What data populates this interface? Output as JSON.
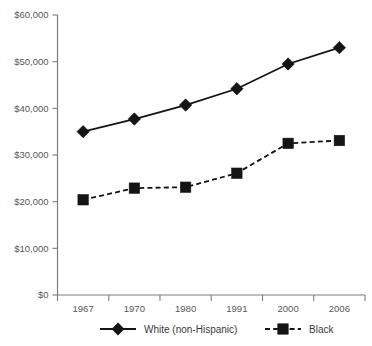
{
  "chart_data": {
    "type": "line",
    "title": "",
    "subtitle": "",
    "xlabel": "",
    "ylabel": "",
    "categories": [
      "1967",
      "1970",
      "1980",
      "1991",
      "2000",
      "2006"
    ],
    "series": [
      {
        "name": "White (non-Hispanic)",
        "marker": "diamond",
        "line_style": "solid",
        "color": "#141414",
        "values": [
          35000,
          37700,
          40700,
          44200,
          49500,
          53000
        ]
      },
      {
        "name": "Black",
        "marker": "square",
        "line_style": "dashed",
        "color": "#141414",
        "values": [
          20400,
          22900,
          23100,
          26100,
          32500,
          33100
        ]
      }
    ],
    "ylim": [
      0,
      60000
    ],
    "ytick_values": [
      0,
      10000,
      20000,
      30000,
      40000,
      50000,
      60000
    ],
    "ytick_labels": [
      "$0",
      "$10,000",
      "$20,000",
      "$30,000",
      "$40,000",
      "$50,000",
      "$60,000"
    ],
    "grid": false,
    "legend_position": "bottom",
    "legend_entries": [
      {
        "label": "White (non-Hispanic)",
        "marker": "diamond",
        "line_style": "solid"
      },
      {
        "label": "Black",
        "marker": "square",
        "line_style": "dashed"
      }
    ]
  }
}
